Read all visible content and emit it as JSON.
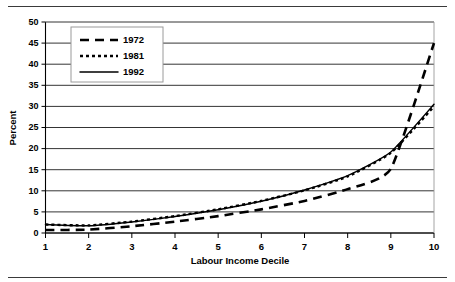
{
  "figure": {
    "top_rule": "horizontal-rule",
    "bottom_rule": "horizontal-rule"
  },
  "chart_data": {
    "type": "line",
    "title": "",
    "xlabel": "Labour Income Decile",
    "ylabel": "Percent",
    "categories": [
      1,
      2,
      3,
      4,
      5,
      6,
      7,
      8,
      9,
      10
    ],
    "x": [
      1,
      2,
      3,
      4,
      5,
      6,
      7,
      8,
      9,
      10
    ],
    "xlim": [
      1,
      10
    ],
    "ylim": [
      0,
      50
    ],
    "yticks": [
      0,
      5,
      10,
      15,
      20,
      25,
      30,
      35,
      40,
      45,
      50
    ],
    "xticks": [
      1,
      2,
      3,
      4,
      5,
      6,
      7,
      8,
      9,
      10
    ],
    "grid": "horizontal",
    "legend_position": "upper-left-inside",
    "series": [
      {
        "name": "1972",
        "style": "long-dash",
        "color": "#000000",
        "values": [
          0.7,
          0.8,
          1.6,
          2.7,
          4.0,
          5.6,
          7.6,
          10.4,
          15.2,
          45.0
        ]
      },
      {
        "name": "1981",
        "style": "short-dash",
        "color": "#000000",
        "values": [
          2.0,
          1.8,
          2.7,
          4.0,
          5.6,
          7.6,
          10.1,
          13.4,
          19.0,
          30.0
        ]
      },
      {
        "name": "1992",
        "style": "solid",
        "color": "#000000",
        "values": [
          2.0,
          1.7,
          2.6,
          3.9,
          5.5,
          7.5,
          10.2,
          13.6,
          19.2,
          30.5
        ]
      }
    ]
  },
  "axis": {
    "y_title": "Percent",
    "x_title": "Labour Income Decile",
    "y_tick_labels": [
      "0",
      "5",
      "10",
      "15",
      "20",
      "25",
      "30",
      "35",
      "40",
      "45",
      "50"
    ],
    "x_tick_labels": [
      "1",
      "2",
      "3",
      "4",
      "5",
      "6",
      "7",
      "8",
      "9",
      "10"
    ]
  },
  "legend": {
    "entries": [
      {
        "label": "1972",
        "style": "long-dash"
      },
      {
        "label": "1981",
        "style": "short-dash"
      },
      {
        "label": "1992",
        "style": "solid"
      }
    ]
  },
  "colors": {
    "ink": "#000000",
    "frame": "#9a9a9a",
    "rule": "#3a3a3a",
    "background": "#ffffff"
  }
}
